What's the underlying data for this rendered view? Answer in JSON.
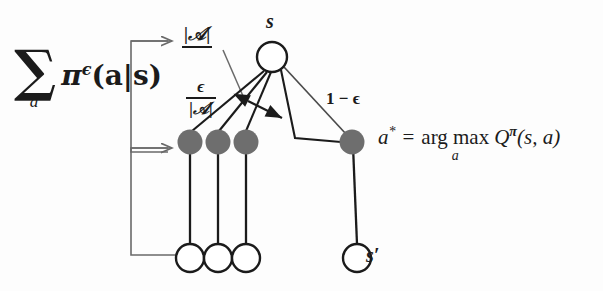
{
  "figure": {
    "background_color": "#fdfdfd",
    "stroke_color": "#1b1b1b",
    "action_node_fill": "#6e6e6e",
    "bracket_color": "#6a6a6a"
  },
  "left_expression": {
    "sum_sign": "∑",
    "sum_subscript": "a",
    "policy_term_pi": "π",
    "policy_term_superscript": "ϵ",
    "policy_term_args": "(a|s)",
    "full_text": "∑_a π^ϵ(a|s)"
  },
  "labels": {
    "cardinality_top": "|𝒜|",
    "epsilon_over_cardinality": {
      "numerator": "ϵ",
      "denominator": "|𝒜|",
      "full_text": "ϵ / |𝒜|"
    },
    "one_minus_epsilon": "1 − ϵ",
    "state": "s",
    "next_state": "s′"
  },
  "argmax_formula": {
    "lhs": "a",
    "lhs_superscript": "*",
    "equals": "=",
    "operator": "arg max",
    "operator_subscript": "a",
    "q_symbol": "Q",
    "q_superscript": "π",
    "q_args": "(s, a)",
    "full_text": "a* = arg max_a Q^π(s, a)"
  },
  "nodes": {
    "state_node": {
      "label": "s",
      "type": "open-circle",
      "x": 272,
      "y": 57,
      "r": 15
    },
    "action_nodes": [
      {
        "label": "",
        "type": "filled-circle",
        "x": 190,
        "y": 142,
        "r": 12
      },
      {
        "label": "",
        "type": "filled-circle",
        "x": 218,
        "y": 142,
        "r": 12
      },
      {
        "label": "",
        "type": "filled-circle",
        "x": 246,
        "y": 142,
        "r": 12
      },
      {
        "label": "a*",
        "type": "filled-circle",
        "x": 352,
        "y": 142,
        "r": 12
      }
    ],
    "next_state_nodes": [
      {
        "label": "",
        "type": "open-circle",
        "x": 190,
        "y": 258,
        "r": 14
      },
      {
        "label": "",
        "type": "open-circle",
        "x": 218,
        "y": 258,
        "r": 14
      },
      {
        "label": "",
        "type": "open-circle",
        "x": 246,
        "y": 258,
        "r": 14
      },
      {
        "label": "s′",
        "type": "open-circle",
        "x": 357,
        "y": 258,
        "r": 14
      }
    ]
  },
  "brackets": [
    {
      "name": "upper-bracket",
      "arrow": "→",
      "points_to": "state-node-row"
    },
    {
      "name": "lower-bracket",
      "arrow": "→",
      "points_to": "action-node-row"
    }
  ]
}
